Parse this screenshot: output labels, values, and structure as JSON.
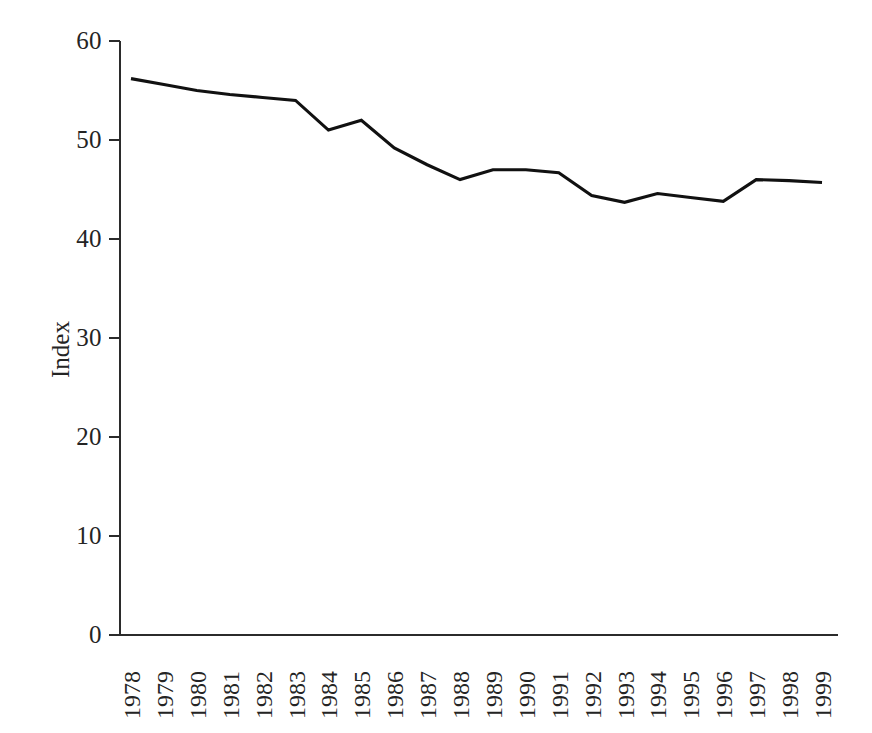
{
  "chart_data": {
    "type": "line",
    "title": "",
    "subtitle": "",
    "xlabel": "",
    "ylabel": "Index",
    "categories": [
      "1978",
      "1979",
      "1980",
      "1981",
      "1982",
      "1983",
      "1984",
      "1985",
      "1986",
      "1987",
      "1988",
      "1989",
      "1990",
      "1991",
      "1992",
      "1993",
      "1994",
      "1995",
      "1996",
      "1997",
      "1998",
      "1999"
    ],
    "values": [
      56.2,
      55.6,
      55.0,
      54.6,
      54.3,
      54.0,
      51.0,
      52.0,
      49.2,
      47.5,
      46.0,
      47.0,
      47.0,
      46.7,
      44.4,
      43.7,
      44.6,
      44.2,
      43.8,
      46.0,
      45.9,
      45.7
    ],
    "series": [
      {
        "name": "Index",
        "color": "#111111",
        "values": [
          56.2,
          55.6,
          55.0,
          54.6,
          54.3,
          54.0,
          51.0,
          52.0,
          49.2,
          47.5,
          46.0,
          47.0,
          47.0,
          46.7,
          44.4,
          43.7,
          44.6,
          44.2,
          43.8,
          46.0,
          45.9,
          45.7
        ]
      }
    ],
    "ylim": [
      0,
      60
    ],
    "yticks": [
      0,
      10,
      20,
      30,
      40,
      50,
      60
    ],
    "ytick_labels": [
      "0",
      "10",
      "20",
      "30",
      "40",
      "50",
      "60"
    ],
    "xtick_labels": [
      "1978",
      "1979",
      "1980",
      "1981",
      "1982",
      "1983",
      "1984",
      "1985",
      "1986",
      "1987",
      "1988",
      "1989",
      "1990",
      "1991",
      "1992",
      "1993",
      "1994",
      "1995",
      "1996",
      "1997",
      "1998",
      "1999"
    ],
    "grid": false,
    "legend": false,
    "legend_position": "none",
    "annotations": [],
    "axis_color": "#2b2b2b",
    "background_color": "#ffffff",
    "xtick_rotation": -90
  },
  "layout": {
    "plot_left": 120,
    "plot_right": 838,
    "plot_top": 41,
    "plot_bottom": 635
  }
}
